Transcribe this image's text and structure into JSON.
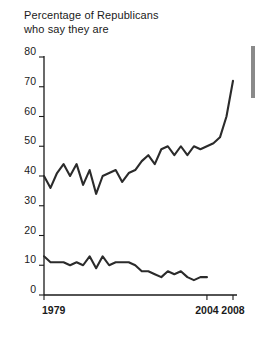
{
  "chart": {
    "title_line1": "Percentage of Republicans",
    "title_line2": "who say they are",
    "line_color": "#2b2b2b",
    "axis_color": "#1a1a1a"
  },
  "chart_data": {
    "type": "line",
    "title": "Percentage of Republicans who say they are",
    "xlabel": "",
    "ylabel": "",
    "xlim": [
      1979,
      2008
    ],
    "ylim": [
      0,
      80
    ],
    "ytick_labels": [
      "0",
      "10",
      "20",
      "30",
      "40",
      "50",
      "60",
      "70",
      "80"
    ],
    "yticks": [
      0,
      10,
      20,
      30,
      40,
      50,
      60,
      70,
      80
    ],
    "xtick_labels": [
      "1979",
      "2004",
      "2008"
    ],
    "xticks": [
      1979,
      2004,
      2008
    ],
    "grid": false,
    "legend": "none",
    "series": [
      {
        "name": "upper-series",
        "x": [
          1979,
          1980,
          1981,
          1982,
          1983,
          1984,
          1985,
          1986,
          1987,
          1988,
          1989,
          1990,
          1991,
          1992,
          1993,
          1994,
          1995,
          1996,
          1997,
          1998,
          1999,
          2000,
          2001,
          2002,
          2003,
          2004,
          2005,
          2006,
          2007,
          2008
        ],
        "values": [
          40,
          36,
          41,
          44,
          40,
          44,
          37,
          42,
          34,
          40,
          41,
          42,
          38,
          41,
          42,
          45,
          47,
          44,
          49,
          50,
          47,
          50,
          47,
          50,
          49,
          50,
          51,
          53,
          60,
          72
        ]
      },
      {
        "name": "lower-series",
        "x": [
          1979,
          1980,
          1981,
          1982,
          1983,
          1984,
          1985,
          1986,
          1987,
          1988,
          1989,
          1990,
          1991,
          1992,
          1993,
          1994,
          1995,
          1996,
          1997,
          1998,
          1999,
          2000,
          2001,
          2002,
          2003,
          2004
        ],
        "values": [
          13,
          11,
          11,
          11,
          10,
          11,
          10,
          13,
          9,
          13,
          10,
          11,
          11,
          11,
          10,
          8,
          8,
          7,
          6,
          8,
          7,
          8,
          6,
          5,
          6,
          6
        ]
      }
    ]
  }
}
